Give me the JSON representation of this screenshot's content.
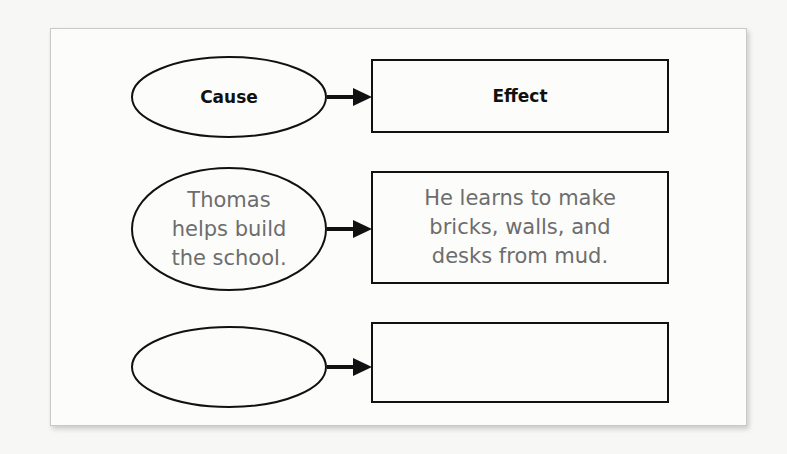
{
  "diagram": {
    "type": "cause-effect organizer",
    "header": {
      "cause": "Cause",
      "effect": "Effect"
    },
    "rows": [
      {
        "cause": "Thomas helps build the school.",
        "cause_lines": [
          "Thomas",
          "helps build",
          "the school."
        ],
        "effect": "He learns to make bricks, walls, and desks from mud.",
        "effect_lines": [
          "He learns to make",
          "bricks, walls, and",
          "desks from mud."
        ]
      },
      {
        "cause": "",
        "effect": ""
      }
    ],
    "colors": {
      "stroke": "#111111",
      "body_text": "#6d6d6d",
      "panel_bg": "#fcfcfb",
      "panel_border": "#c9c9c9"
    }
  }
}
